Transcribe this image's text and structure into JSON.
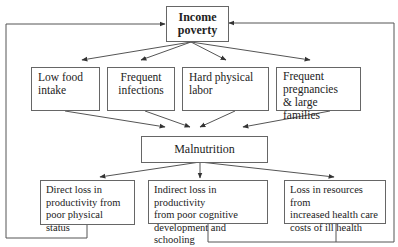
{
  "diagram": {
    "root": {
      "label_line1": "Income",
      "label_line2": "poverty"
    },
    "causes": [
      {
        "lines": [
          "Low food",
          "intake"
        ]
      },
      {
        "lines": [
          "Frequent",
          "infections"
        ]
      },
      {
        "lines": [
          "Hard physical",
          "labor"
        ]
      },
      {
        "lines": [
          "Frequent",
          "pregnancies",
          "& large families"
        ]
      }
    ],
    "center": {
      "label": "Malnutrition"
    },
    "consequences": [
      {
        "lines": [
          "Direct loss in",
          "productivity from",
          "poor physical status"
        ]
      },
      {
        "lines": [
          "Indirect loss in productivity",
          "from poor cognitive",
          "development and schooling"
        ]
      },
      {
        "lines": [
          "Loss in resources from",
          "increased health care",
          "costs of ill health"
        ]
      }
    ],
    "colors": {
      "line": "#555555",
      "box_border": "#666666",
      "text": "#222222"
    }
  }
}
